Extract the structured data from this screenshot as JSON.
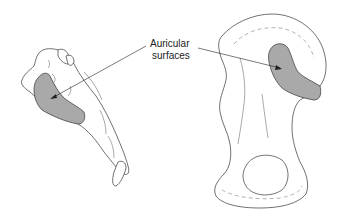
{
  "figure": {
    "label_line1": "Auricular",
    "label_line2": "surfaces",
    "bones": [
      {
        "name": "sacrum",
        "view": "lateral"
      },
      {
        "name": "ilium",
        "view": "medial"
      }
    ],
    "colors": {
      "surface_fill": "#a9a9a9",
      "outline": "#333333",
      "background": "#ffffff"
    }
  }
}
